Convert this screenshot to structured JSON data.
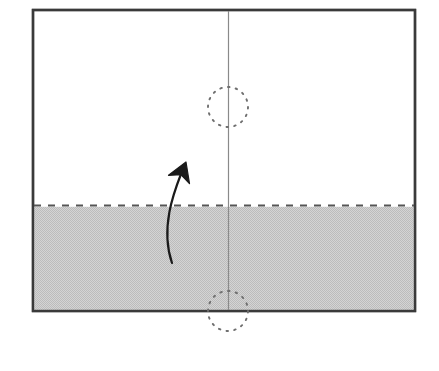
{
  "figure": {
    "canvas": {
      "width": 439,
      "height": 371,
      "background": "#ffffff"
    }
  },
  "colors": {
    "paper_fill": "#ffffff",
    "shaded_fill": "#cccccc",
    "outline": "#3a3a3a",
    "fold_line": "#555555",
    "center_line": "#8a8a8a",
    "dotted_circle": "#6f6f6f",
    "arrow": "#1a1a1a"
  },
  "sheet": {
    "name": "paper-sheet",
    "x": 33,
    "y": 10,
    "width": 382,
    "height": 301,
    "stroke_width": 2.4
  },
  "center_line": {
    "name": "vertical-center-line",
    "x": 228.5,
    "y_top": 11,
    "y_bottom": 310,
    "stroke_width": 1.2
  },
  "fold_line": {
    "name": "horizontal-fold-line",
    "y": 205.5,
    "x_start": 34,
    "x_end": 414,
    "stroke_width": 2.2,
    "dash": "7 7",
    "style": "dashed"
  },
  "shaded_band": {
    "name": "shaded-flap",
    "x": 34,
    "y": 207,
    "width": 380,
    "height": 103,
    "fill": "#cccccc",
    "texture": "halftone-dither"
  },
  "rotation_circles": [
    {
      "name": "rotation-circle-top",
      "cx": 228,
      "cy": 107,
      "r": 20,
      "style": "dotted",
      "dash": "1.6 6.2"
    },
    {
      "name": "rotation-circle-bottom",
      "cx": 228,
      "cy": 311,
      "r": 20,
      "style": "dotted",
      "dash": "1.6 6.2"
    }
  ],
  "fold_arrow": {
    "name": "fold-direction-arrow",
    "direction": "up",
    "tail": {
      "x": 172,
      "y": 263
    },
    "control_1": {
      "x": 160,
      "y": 228
    },
    "control_2": {
      "x": 174,
      "y": 192
    },
    "head_tip": {
      "x": 186,
      "y": 162
    },
    "stroke_width": 2.2,
    "head_length": 22,
    "head_angle_deg": 62
  },
  "labels": {
    "diagram_label": "",
    "step_number": ""
  }
}
